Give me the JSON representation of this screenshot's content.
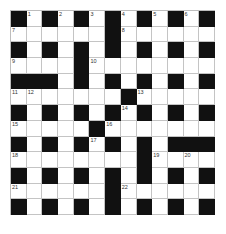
{
  "puzzle": {
    "size": 13,
    "rows": [
      "#.#.#.#.#.#.#",
      "......#......",
      "#.#.#.#.#.#.#",
      "....#........",
      "###.#.#.#.#.#",
      ".......#.....",
      "#.#.#.#.#.#.#",
      ".....#.......",
      "#.#.#.#.#.###",
      "........#....",
      "#.#.#.#.#.#.#",
      "......#......",
      "#.#.#.#.#.#.#"
    ],
    "numbers": [
      {
        "r": 0,
        "c": 1,
        "n": "1"
      },
      {
        "r": 0,
        "c": 3,
        "n": "2"
      },
      {
        "r": 0,
        "c": 5,
        "n": "3"
      },
      {
        "r": 0,
        "c": 7,
        "n": "4"
      },
      {
        "r": 0,
        "c": 9,
        "n": "5"
      },
      {
        "r": 0,
        "c": 11,
        "n": "6"
      },
      {
        "r": 1,
        "c": 0,
        "n": "7"
      },
      {
        "r": 1,
        "c": 7,
        "n": "8"
      },
      {
        "r": 3,
        "c": 0,
        "n": "9"
      },
      {
        "r": 3,
        "c": 5,
        "n": "10"
      },
      {
        "r": 5,
        "c": 0,
        "n": "11"
      },
      {
        "r": 5,
        "c": 1,
        "n": "12"
      },
      {
        "r": 5,
        "c": 8,
        "n": "13"
      },
      {
        "r": 6,
        "c": 7,
        "n": "14"
      },
      {
        "r": 7,
        "c": 0,
        "n": "15"
      },
      {
        "r": 7,
        "c": 6,
        "n": "16"
      },
      {
        "r": 8,
        "c": 5,
        "n": "17"
      },
      {
        "r": 9,
        "c": 0,
        "n": "18"
      },
      {
        "r": 9,
        "c": 9,
        "n": "19"
      },
      {
        "r": 9,
        "c": 11,
        "n": "20"
      },
      {
        "r": 11,
        "c": 0,
        "n": "21"
      },
      {
        "r": 11,
        "c": 7,
        "n": "22"
      }
    ],
    "colors": {
      "black": "#111111",
      "white": "#ffffff",
      "gridline": "#c4c4c4"
    }
  }
}
